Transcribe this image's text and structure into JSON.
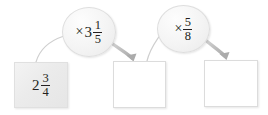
{
  "diagram": {
    "type": "function-machine-flow",
    "background_color": "#ffffff",
    "ink_color": "#231f20",
    "arrow_color": "#b8b8b8",
    "box_border_color": "#dcdcdc",
    "nodes": [
      {
        "id": "input-box",
        "role": "input-value",
        "shape": "square",
        "filled": true,
        "value": {
          "kind": "mixed-number",
          "whole": "2",
          "numerator": "3",
          "denominator": "4",
          "text": "2 3/4"
        }
      },
      {
        "id": "operator-1",
        "role": "operation",
        "shape": "oval",
        "value": {
          "kind": "multiply-mixed-number",
          "operator": "×",
          "whole": "3",
          "numerator": "1",
          "denominator": "5",
          "text": "× 3 1/5"
        }
      },
      {
        "id": "result-box-1",
        "role": "answer-blank",
        "shape": "square",
        "filled": false,
        "value": {
          "kind": "blank",
          "text": ""
        }
      },
      {
        "id": "operator-2",
        "role": "operation",
        "shape": "oval",
        "value": {
          "kind": "multiply-fraction",
          "operator": "×",
          "numerator": "5",
          "denominator": "8",
          "text": "× 5/8"
        }
      },
      {
        "id": "result-box-2",
        "role": "answer-blank",
        "shape": "square",
        "filled": false,
        "value": {
          "kind": "blank",
          "text": ""
        }
      }
    ],
    "connectors": [
      {
        "id": "c1",
        "from": "input-box",
        "to": "operator-1",
        "style": "thin-curve",
        "arrowhead": false
      },
      {
        "id": "c2",
        "from": "operator-1",
        "to": "result-box-1",
        "style": "thick-curve",
        "arrowhead": true
      },
      {
        "id": "c3",
        "from": "result-box-1",
        "to": "operator-2",
        "style": "thin-curve",
        "arrowhead": false
      },
      {
        "id": "c4",
        "from": "operator-2",
        "to": "result-box-2",
        "style": "thick-curve",
        "arrowhead": true
      }
    ]
  },
  "glyphs": {
    "multiplication_sign": "×"
  }
}
